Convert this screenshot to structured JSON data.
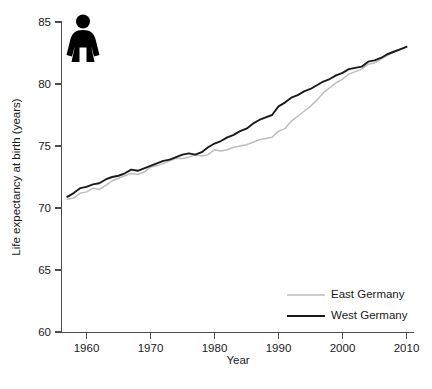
{
  "chart_data": {
    "type": "line",
    "title": "",
    "subtitle": "",
    "xlabel": "Year",
    "ylabel": "Life expectancy at birth (years)",
    "xlim": [
      1956,
      2010
    ],
    "ylim": [
      60,
      85
    ],
    "xticks": [
      1960,
      1970,
      1980,
      1990,
      2000,
      2010
    ],
    "xtick_labels": [
      "1960",
      "1970",
      "1980",
      "1990",
      "2000",
      "2010"
    ],
    "yticks": [
      60,
      65,
      70,
      75,
      80,
      85
    ],
    "ytick_labels": [
      "60",
      "65",
      "70",
      "75",
      "80",
      "85"
    ],
    "grid": false,
    "legend_position": "bottom-right",
    "annotations": [
      {
        "name": "female-pictogram",
        "label": "female figure icon",
        "x": 1959,
        "y": 84.0
      }
    ],
    "x": [
      1957,
      1958,
      1959,
      1960,
      1961,
      1962,
      1963,
      1964,
      1965,
      1966,
      1967,
      1968,
      1969,
      1970,
      1971,
      1972,
      1973,
      1974,
      1975,
      1976,
      1977,
      1978,
      1979,
      1980,
      1981,
      1982,
      1983,
      1984,
      1985,
      1986,
      1987,
      1988,
      1989,
      1990,
      1991,
      1992,
      1993,
      1994,
      1995,
      1996,
      1997,
      1998,
      1999,
      2000,
      2001,
      2002,
      2003,
      2004,
      2005,
      2006,
      2007,
      2008,
      2009,
      2010
    ],
    "series": [
      {
        "name": "East Germany",
        "color": "#bdbdbd",
        "values": [
          70.7,
          70.8,
          71.2,
          71.3,
          71.6,
          71.5,
          71.8,
          72.2,
          72.4,
          72.6,
          72.8,
          72.7,
          72.9,
          73.3,
          73.4,
          73.6,
          73.8,
          74.0,
          74.0,
          74.1,
          74.3,
          74.2,
          74.3,
          74.7,
          74.6,
          74.7,
          74.9,
          75.0,
          75.1,
          75.3,
          75.5,
          75.6,
          75.7,
          76.2,
          76.4,
          77.0,
          77.4,
          77.8,
          78.2,
          78.7,
          79.3,
          79.7,
          80.1,
          80.4,
          80.8,
          81.0,
          81.2,
          81.6,
          81.7,
          82.0,
          82.3,
          82.6,
          82.8,
          83.0
        ]
      },
      {
        "name": "West Germany",
        "color": "#1a1a1a",
        "values": [
          70.9,
          71.2,
          71.6,
          71.7,
          71.9,
          72.0,
          72.3,
          72.5,
          72.6,
          72.8,
          73.1,
          73.0,
          73.2,
          73.4,
          73.6,
          73.8,
          73.9,
          74.1,
          74.3,
          74.4,
          74.3,
          74.5,
          74.9,
          75.2,
          75.4,
          75.7,
          75.9,
          76.2,
          76.4,
          76.8,
          77.1,
          77.3,
          77.5,
          78.2,
          78.5,
          78.9,
          79.1,
          79.4,
          79.6,
          79.9,
          80.2,
          80.4,
          80.7,
          80.9,
          81.2,
          81.3,
          81.4,
          81.8,
          81.9,
          82.1,
          82.4,
          82.6,
          82.8,
          83.0
        ]
      }
    ]
  },
  "axes": {
    "ylabel": "Life expectancy at birth (years)",
    "xlabel": "Year"
  },
  "legend": {
    "items": [
      {
        "label": "East Germany",
        "color": "#bdbdbd"
      },
      {
        "label": "West Germany",
        "color": "#1a1a1a"
      }
    ]
  },
  "icon": {
    "name": "female-figure-icon",
    "color": "#000000"
  }
}
